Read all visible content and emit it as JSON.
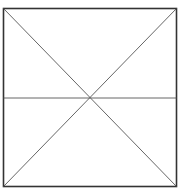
{
  "diagram": {
    "type": "square-with-diagonals-and-midline",
    "square": {
      "x": 3.5,
      "y": 8.5,
      "width": 173,
      "height": 178
    },
    "lines": [
      {
        "name": "diagonal-tl-br",
        "x1": 3.5,
        "y1": 8.5,
        "x2": 176.5,
        "y2": 186.5
      },
      {
        "name": "diagonal-tr-bl",
        "x1": 176.5,
        "y1": 8.5,
        "x2": 3.5,
        "y2": 186.5
      },
      {
        "name": "horizontal-midline",
        "x1": 3.5,
        "y1": 98,
        "x2": 176.5,
        "y2": 98
      }
    ],
    "colors": {
      "border": "#333333",
      "lines": "#555555",
      "background": "#ffffff"
    }
  }
}
